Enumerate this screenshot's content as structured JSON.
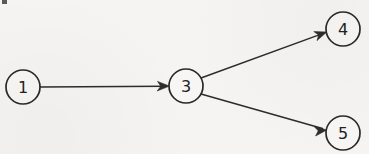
{
  "diagram": {
    "type": "directed-graph",
    "background_color": "#f5f4f2",
    "stroke_color": "#2b2926",
    "label_color": "#232120",
    "node_radius": 17,
    "nodes": [
      {
        "id": "1",
        "label": "1",
        "cx": 23,
        "cy": 87
      },
      {
        "id": "3",
        "label": "3",
        "cx": 186,
        "cy": 86
      },
      {
        "id": "4",
        "label": "4",
        "cx": 343,
        "cy": 29
      },
      {
        "id": "5",
        "label": "5",
        "cx": 343,
        "cy": 133
      }
    ],
    "edges": [
      {
        "id": "edge-1-3",
        "from": "1",
        "to": "3",
        "directed": true,
        "x1": 40,
        "y1": 87,
        "x2": 169,
        "y2": 86
      },
      {
        "id": "edge-3-4",
        "from": "3",
        "to": "4",
        "directed": true,
        "x1": 201,
        "y1": 78,
        "x2": 327,
        "y2": 32
      },
      {
        "id": "edge-3-5",
        "from": "3",
        "to": "5",
        "directed": true,
        "x1": 201,
        "y1": 94,
        "x2": 327,
        "y2": 130
      }
    ],
    "artifact": {
      "name": "scan-speck",
      "x": 2,
      "y": 0,
      "w": 5,
      "h": 4
    }
  }
}
